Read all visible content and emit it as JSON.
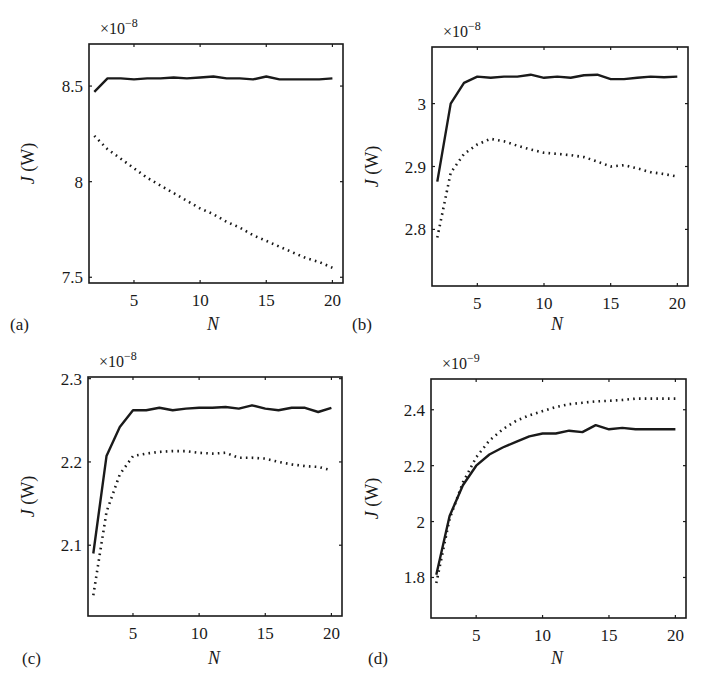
{
  "figure": {
    "panels": [
      {
        "id": "a",
        "label": "(a)",
        "xlabel": "N",
        "ylabel": "J (W)",
        "exponent": "×10",
        "exponent_power": "−8"
      },
      {
        "id": "b",
        "label": "(b)",
        "xlabel": "N",
        "ylabel": "J (W)",
        "exponent": "×10",
        "exponent_power": "−8"
      },
      {
        "id": "c",
        "label": "(c)",
        "xlabel": "N",
        "ylabel": "J (W)",
        "exponent": "×10",
        "exponent_power": "−8"
      },
      {
        "id": "d",
        "label": "(d)",
        "xlabel": "N",
        "ylabel": "J (W)",
        "exponent": "×10",
        "exponent_power": "−9"
      }
    ]
  },
  "chart_data": [
    {
      "type": "line",
      "title": "(a)",
      "xlabel": "N",
      "ylabel": "J (W)",
      "y_scale_factor": "×10^-8",
      "xlim": [
        1.6,
        20.8
      ],
      "ylim": [
        7.47,
        8.72
      ],
      "xticks": [
        5,
        10,
        15,
        20
      ],
      "yticks": [
        7.5,
        8,
        8.5
      ],
      "ytick_labels": [
        "7.5",
        "8",
        "8.5"
      ],
      "grid": false,
      "x": [
        2,
        3,
        4,
        5,
        6,
        7,
        8,
        9,
        10,
        11,
        12,
        13,
        14,
        15,
        16,
        17,
        18,
        19,
        20
      ],
      "series": [
        {
          "name": "solid",
          "style": "solid",
          "values": [
            8.47,
            8.54,
            8.54,
            8.535,
            8.54,
            8.54,
            8.545,
            8.54,
            8.545,
            8.55,
            8.54,
            8.54,
            8.535,
            8.55,
            8.535,
            8.535,
            8.535,
            8.535,
            8.54
          ]
        },
        {
          "name": "dotted",
          "style": "dotted",
          "values": [
            8.24,
            8.17,
            8.12,
            8.07,
            8.02,
            7.98,
            7.94,
            7.9,
            7.86,
            7.83,
            7.79,
            7.76,
            7.72,
            7.69,
            7.66,
            7.63,
            7.6,
            7.58,
            7.55
          ]
        }
      ]
    },
    {
      "type": "line",
      "title": "(b)",
      "xlabel": "N",
      "ylabel": "J (W)",
      "y_scale_factor": "×10^-8",
      "xlim": [
        1.6,
        20.8
      ],
      "ylim": [
        2.71,
        3.09
      ],
      "xticks": [
        5,
        10,
        15,
        20
      ],
      "yticks": [
        2.8,
        2.9,
        3.0
      ],
      "ytick_labels": [
        "2.8",
        "2.9",
        "3"
      ],
      "grid": false,
      "x": [
        2,
        3,
        4,
        5,
        6,
        7,
        8,
        9,
        10,
        11,
        12,
        13,
        14,
        15,
        16,
        17,
        18,
        19,
        20
      ],
      "series": [
        {
          "name": "solid",
          "style": "solid",
          "values": [
            2.876,
            3.0,
            3.033,
            3.043,
            3.041,
            3.043,
            3.043,
            3.046,
            3.041,
            3.043,
            3.041,
            3.045,
            3.046,
            3.039,
            3.039,
            3.041,
            3.043,
            3.042,
            3.043
          ]
        },
        {
          "name": "dotted",
          "style": "dotted",
          "values": [
            2.787,
            2.89,
            2.92,
            2.935,
            2.944,
            2.94,
            2.933,
            2.927,
            2.922,
            2.92,
            2.918,
            2.915,
            2.908,
            2.9,
            2.902,
            2.897,
            2.891,
            2.888,
            2.884
          ]
        }
      ]
    },
    {
      "type": "line",
      "title": "(c)",
      "xlabel": "N",
      "ylabel": "J (W)",
      "y_scale_factor": "×10^-8",
      "xlim": [
        1.6,
        20.8
      ],
      "ylim": [
        2.015,
        2.302
      ],
      "xticks": [
        5,
        10,
        15,
        20
      ],
      "yticks": [
        2.1,
        2.2,
        2.3
      ],
      "ytick_labels": [
        "2.1",
        "2.2",
        "2.3"
      ],
      "grid": false,
      "x": [
        2,
        3,
        4,
        5,
        6,
        7,
        8,
        9,
        10,
        11,
        12,
        13,
        14,
        15,
        16,
        17,
        18,
        19,
        20
      ],
      "series": [
        {
          "name": "solid",
          "style": "solid",
          "values": [
            2.09,
            2.207,
            2.242,
            2.262,
            2.262,
            2.265,
            2.262,
            2.264,
            2.265,
            2.265,
            2.266,
            2.264,
            2.268,
            2.264,
            2.262,
            2.265,
            2.265,
            2.26,
            2.265
          ]
        },
        {
          "name": "dotted",
          "style": "dotted",
          "values": [
            2.04,
            2.14,
            2.185,
            2.207,
            2.21,
            2.212,
            2.213,
            2.213,
            2.211,
            2.21,
            2.211,
            2.205,
            2.205,
            2.204,
            2.2,
            2.197,
            2.195,
            2.194,
            2.19
          ]
        }
      ]
    },
    {
      "type": "line",
      "title": "(d)",
      "xlabel": "N",
      "ylabel": "J (W)",
      "y_scale_factor": "×10^-9",
      "xlim": [
        1.6,
        20.8
      ],
      "ylim": [
        1.655,
        2.51
      ],
      "xticks": [
        5,
        10,
        15,
        20
      ],
      "yticks": [
        1.8,
        2.0,
        2.2,
        2.4
      ],
      "ytick_labels": [
        "1.8",
        "2",
        "2.2",
        "2.4"
      ],
      "grid": false,
      "x": [
        2,
        3,
        4,
        5,
        6,
        7,
        8,
        9,
        10,
        11,
        12,
        13,
        14,
        15,
        16,
        17,
        18,
        19,
        20
      ],
      "series": [
        {
          "name": "solid",
          "style": "solid",
          "values": [
            1.81,
            2.02,
            2.13,
            2.2,
            2.24,
            2.265,
            2.285,
            2.305,
            2.315,
            2.315,
            2.325,
            2.32,
            2.345,
            2.33,
            2.335,
            2.33,
            2.33,
            2.33,
            2.33
          ]
        },
        {
          "name": "dotted",
          "style": "dotted",
          "values": [
            1.78,
            2.01,
            2.14,
            2.23,
            2.29,
            2.33,
            2.36,
            2.38,
            2.395,
            2.41,
            2.42,
            2.425,
            2.43,
            2.432,
            2.435,
            2.44,
            2.44,
            2.44,
            2.44
          ]
        }
      ]
    }
  ]
}
